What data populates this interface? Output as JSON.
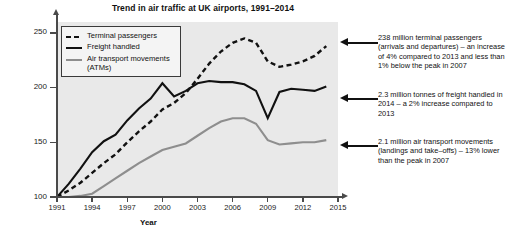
{
  "chart_data": {
    "type": "line",
    "title": "Trend in air traffic at UK airports, 1991–2014",
    "xlabel": "Year",
    "ylabel": "Millions",
    "xlim": [
      1991,
      2015
    ],
    "ylim": [
      100,
      260
    ],
    "xticks": [
      "1991",
      "1994",
      "1997",
      "2000",
      "2003",
      "2006",
      "2009",
      "2012",
      "2015"
    ],
    "xtick_values": [
      1991,
      1994,
      1997,
      2000,
      2003,
      2006,
      2009,
      2012,
      2015
    ],
    "yticks": [
      "100",
      "150",
      "200",
      "250"
    ],
    "ytick_values": [
      100,
      150,
      200,
      250
    ],
    "grid": false,
    "legend_position": "top-left",
    "note": "All three series are indexed so that 1991 = 100",
    "x": [
      1991,
      1992,
      1993,
      1994,
      1995,
      1996,
      1997,
      1998,
      1999,
      2000,
      2001,
      2002,
      2003,
      2004,
      2005,
      2006,
      2007,
      2008,
      2009,
      2010,
      2011,
      2012,
      2013,
      2014
    ],
    "series": [
      {
        "name": "Terminal passengers",
        "style": "dashed",
        "color": "#111111",
        "values": [
          100,
          106,
          113,
          122,
          131,
          139,
          150,
          160,
          169,
          180,
          186,
          195,
          208,
          222,
          233,
          241,
          245,
          241,
          224,
          219,
          221,
          224,
          229,
          238
        ]
      },
      {
        "name": "Freight handled",
        "style": "solid",
        "color": "#111111",
        "values": [
          100,
          112,
          126,
          141,
          151,
          157,
          170,
          181,
          190,
          204,
          192,
          197,
          204,
          206,
          205,
          205,
          203,
          197,
          172,
          196,
          199,
          198,
          197,
          201
        ]
      },
      {
        "name": "Air transport movements (ATMs)",
        "style": "solid",
        "color": "#8e8e8e",
        "values": [
          100,
          100,
          101,
          103,
          110,
          117,
          124,
          131,
          137,
          143,
          146,
          149,
          156,
          163,
          169,
          172,
          172,
          167,
          152,
          148,
          149,
          150,
          150,
          152
        ]
      }
    ],
    "legend": [
      {
        "label": "Terminal passengers",
        "style": "dashed",
        "color": "#111111"
      },
      {
        "label": "Freight handled",
        "style": "solid",
        "color": "#111111"
      },
      {
        "label": "Air transport movements (ATMs)",
        "style": "solid",
        "color": "#8e8e8e"
      }
    ],
    "annotations": [
      {
        "id": "terminal-passengers",
        "text": "238 million terminal passengers (arrivals and departures) – an increase of 4% compared to 2013 and less than 1% below the peak in 2007",
        "points_to_series": "Terminal passengers"
      },
      {
        "id": "freight-handled",
        "text": "2.3 million tonnes of freight handled in 2014 – a 2% increase compared to 2013",
        "points_to_series": "Freight handled"
      },
      {
        "id": "air-transport-movements",
        "text": "2.1 million air transport movements (landings and take–offs) – 13% lower than the peak in 2007",
        "points_to_series": "Air transport movements (ATMs)"
      }
    ]
  }
}
